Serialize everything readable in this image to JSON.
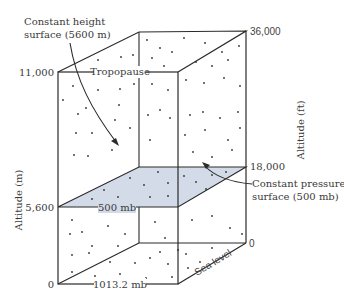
{
  "diagram": {
    "labels": {
      "constant_height_line1": "Constant height",
      "constant_height_line2": "surface (5600 m)",
      "tropopause": "Tropopause",
      "constant_pressure_line1": "Constant pressure",
      "constant_pressure_line2": "surface (500 mb)",
      "plane_pressure": "500 mb",
      "surface_pressure": "1013.2 mb",
      "sea_level": "Sea level"
    },
    "left_axis": {
      "title": "Altitude (m)",
      "ticks": [
        "11,000",
        "5,600",
        "0"
      ]
    },
    "right_axis": {
      "title": "Altitude (ft)",
      "ticks": [
        "36,000",
        "18,000",
        "0"
      ]
    },
    "colors": {
      "outline": "#2a2a2a",
      "plane_fill": "#d3dbe8",
      "dots": "#333333",
      "text": "#3a3a3a"
    }
  }
}
